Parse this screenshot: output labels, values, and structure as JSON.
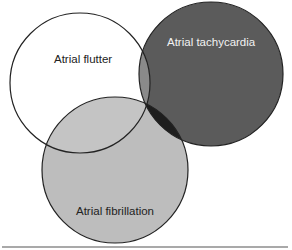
{
  "diagram": {
    "type": "venn",
    "sets": [
      {
        "id": "flutter",
        "label": "Atrial flutter",
        "fill": "#ffffff",
        "text_color": "#222222"
      },
      {
        "id": "tachycardia",
        "label": "Atrial tachycardia",
        "fill": "#5b5b5b",
        "text_color": "#f2f2f2"
      },
      {
        "id": "fibrillation",
        "label": "Atrial fibrillation",
        "fill": "#bdbdbd",
        "text_color": "#222222"
      }
    ],
    "overlap_colors": {
      "flutter_tachycardia": "#8a8a8a",
      "flutter_fibrillation": "#c6c6c6",
      "tachycardia_fibrillation": "#1e1e1e"
    },
    "outline_color": "#222222",
    "divider_color": "#8c8c8c"
  }
}
